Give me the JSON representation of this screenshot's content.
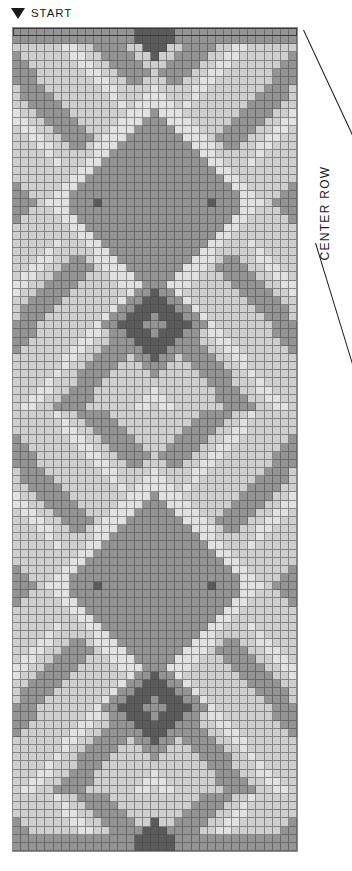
{
  "labels": {
    "start": "START",
    "start_marker_icon": "down-triangle-icon",
    "center_row": "CENTER ROW"
  },
  "palette": {
    "lightest": "#e2e2e2",
    "light": "#cfcfcf",
    "medium": "#949494",
    "dark": "#5b5b5b",
    "grid_line": "#464646",
    "outline": "#3a3a3a"
  },
  "chart_data": {
    "type": "heatmap",
    "title": "",
    "xlabel": "",
    "ylabel": "",
    "columns": 35,
    "rows": 101,
    "cell_size_px": 8.15,
    "legend": [
      "lightest",
      "light",
      "medium",
      "dark"
    ],
    "color_index_map": {
      "0": "#e2e2e2",
      "1": "#cfcfcf",
      "2": "#949494",
      "3": "#5b5b5b"
    },
    "annotations": [
      {
        "text": "START",
        "position": "top-left-above-grid",
        "marker": "down-triangle"
      },
      {
        "text": "CENTER ROW",
        "position": "right-side-vertical",
        "leader_lines": 2
      }
    ],
    "highlighted_row_index": 0,
    "highlight_style": "dark-outline-box",
    "symmetry": "vertical-mirror-about-column-17",
    "motif_notes": [
      "paired diamond 'eye' motifs with single dark center cell at rows 21 and 84",
      "large concentric diamond with dark core at rows 33-40 and 68-75",
      "chevron / zigzag bands in light tones separating motifs",
      "top and bottom edges carry a dark vertical stub at the center column"
    ],
    "grid": "generated"
  }
}
